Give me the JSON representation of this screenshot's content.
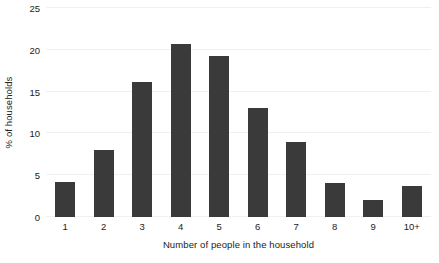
{
  "chart_data": {
    "type": "bar",
    "title": "",
    "xlabel": "Number of people in the household",
    "ylabel": "% of households",
    "categories": [
      "1",
      "2",
      "3",
      "4",
      "5",
      "6",
      "7",
      "8",
      "9",
      "10+"
    ],
    "values": [
      4.2,
      8.0,
      16.2,
      20.7,
      19.3,
      13.0,
      9.0,
      4.1,
      2.0,
      3.7
    ],
    "series": [
      {
        "name": "% of households",
        "values": [
          4.2,
          8.0,
          16.2,
          20.7,
          19.3,
          13.0,
          9.0,
          4.1,
          2.0,
          3.7
        ]
      }
    ],
    "ylim": [
      0,
      25
    ],
    "xlim_categories": 10,
    "yticks": [
      0,
      5,
      10,
      15,
      20,
      25
    ],
    "ytick_labels": [
      "0",
      "5",
      "10",
      "15",
      "20",
      "25"
    ],
    "grid": true,
    "grid_axis": "y",
    "legend": false,
    "legend_position": "none",
    "bar_color": "#3a3a3a",
    "grid_color": "#f0f0f0",
    "text_color": "#222222",
    "background_color": "#ffffff"
  }
}
